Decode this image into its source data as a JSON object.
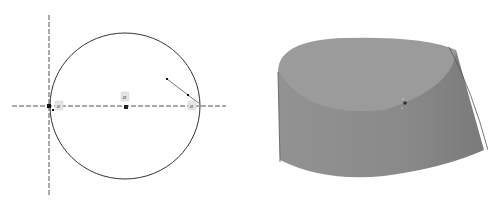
{
  "sketch": {
    "circle": {
      "cx": 125,
      "cy": 106,
      "rx": 75,
      "ry": 73,
      "stroke": "#333333"
    },
    "horizontal_axis": {
      "x1": 12,
      "y1": 106,
      "x2": 226,
      "y2": 106
    },
    "vertical_axis": {
      "x1": 49,
      "y1": 15,
      "x2": 49,
      "y2": 195
    },
    "segment": {
      "points": [
        [
          167,
          79
        ],
        [
          188,
          95
        ],
        [
          200,
          104
        ]
      ]
    },
    "constraint_badges": [
      {
        "label": "⌀",
        "x": 58,
        "y": 102
      },
      {
        "label": "⌀",
        "x": 124,
        "y": 93
      },
      {
        "label": "⌀",
        "x": 190,
        "y": 102
      }
    ],
    "points": [
      {
        "x": 49,
        "y": 106
      },
      {
        "x": 53,
        "y": 110
      },
      {
        "x": 126,
        "y": 107
      },
      {
        "x": 167,
        "y": 79
      },
      {
        "x": 188,
        "y": 95
      }
    ]
  },
  "model": {
    "fill_top": "#9a9a9a",
    "fill_side": "#8d8d8d",
    "fill_side_dark": "#7f7f7f",
    "center_marker": {
      "x": 405,
      "y": 103
    }
  }
}
